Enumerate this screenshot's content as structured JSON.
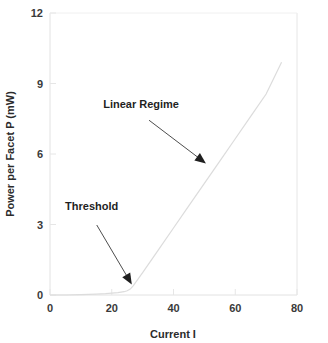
{
  "chart_data": {
    "type": "line",
    "title": "",
    "subtitle": "",
    "xlabel": "Current I",
    "ylabel": "Power per Facet P (mW)",
    "xlim": [
      0,
      80
    ],
    "ylim": [
      0,
      12
    ],
    "xticks": [
      0,
      20,
      40,
      60,
      80
    ],
    "yticks": [
      0,
      3,
      6,
      9,
      12
    ],
    "xtick_labels": [
      "0",
      "20",
      "40",
      "60",
      "80"
    ],
    "ytick_labels": [
      "0",
      "3",
      "6",
      "9",
      "12"
    ],
    "grid": false,
    "legend": "none",
    "series": [
      {
        "name": "L-I curve",
        "color": "#dcdcdc",
        "x": [
          0,
          5,
          10,
          15,
          18,
          20,
          22,
          24,
          25,
          26,
          27,
          30,
          35,
          40,
          45,
          50,
          55,
          60,
          65,
          70,
          75
        ],
        "y": [
          0.0,
          0.0,
          0.02,
          0.04,
          0.06,
          0.08,
          0.1,
          0.14,
          0.18,
          0.25,
          0.4,
          0.95,
          1.9,
          2.85,
          3.8,
          4.75,
          5.7,
          6.65,
          7.6,
          8.55,
          9.9
        ]
      }
    ],
    "annotations": [
      {
        "label": "Linear Regime",
        "label_x": 29.5,
        "label_y": 7.95,
        "point_x": 50.5,
        "point_y": 5.6,
        "arrow": "down-right"
      },
      {
        "label": "Threshold",
        "label_x": 13.5,
        "label_y": 3.6,
        "point_x": 26.5,
        "point_y": 0.45,
        "arrow": "down-left"
      }
    ]
  },
  "axes": {
    "frame_color": "#e0e0e0",
    "tick_color": "#e6e6e6",
    "background": "#ffffff"
  },
  "colors": {
    "curve": "#dcdcdc",
    "text": "#2b2b2b",
    "arrow": "#1f1f1f"
  }
}
